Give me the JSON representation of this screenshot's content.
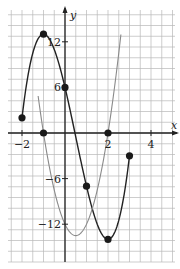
{
  "chart_data": {
    "type": "line",
    "title": "",
    "xlabel": "x",
    "ylabel": "y",
    "xlim": [
      -2.6,
      5.2
    ],
    "ylim": [
      -17.5,
      16.5
    ],
    "grid": true,
    "x_ticks": [
      {
        "value": -2,
        "label": "−2"
      },
      {
        "value": 2,
        "label": "2"
      },
      {
        "value": 4,
        "label": "4"
      }
    ],
    "y_ticks": [
      {
        "value": 12,
        "label": "12"
      },
      {
        "value": 6,
        "label": "6"
      },
      {
        "value": -6,
        "label": "−6"
      },
      {
        "value": -12,
        "label": "−12"
      }
    ],
    "series": [
      {
        "name": "f(x) = 2x^3 - 3x^2 - 12x + 6",
        "color": "#222222",
        "domain": [
          -2,
          3
        ],
        "coefficients": [
          2,
          -3,
          -12,
          6
        ],
        "points": [
          {
            "x": -2,
            "y": 2
          },
          {
            "x": -1,
            "y": 13
          },
          {
            "x": 0,
            "y": 6
          },
          {
            "x": 1,
            "y": -7
          },
          {
            "x": 2,
            "y": -14
          },
          {
            "x": 3,
            "y": -3
          }
        ]
      },
      {
        "name": "f'(x) = 6x^2 - 6x - 12",
        "color": "#8a8a8a",
        "domain": [
          -1.25,
          2.6
        ],
        "coefficients": [
          0,
          6,
          -6,
          -12
        ],
        "points": [
          {
            "x": -1,
            "y": 0
          },
          {
            "x": 2,
            "y": 0
          }
        ]
      }
    ]
  }
}
